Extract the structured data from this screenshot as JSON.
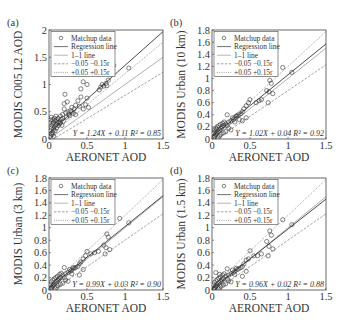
{
  "figure": {
    "xlabel": "AERONET AOD",
    "legend": {
      "items": [
        {
          "label": "Matchup data",
          "style": "marker"
        },
        {
          "label": "Regression line",
          "style": "solid-dark"
        },
        {
          "label": "1–1 line",
          "style": "solid-light"
        },
        {
          "label": "−0.05 −0.15r",
          "style": "dashed"
        },
        {
          "label": "+0.05 +0.15r",
          "style": "dotted"
        }
      ]
    },
    "colors": {
      "axis": "#444444",
      "regression": "#333333",
      "one_to_one": "#999999",
      "error_env": "#777777",
      "marker": "#333333"
    }
  },
  "chart_data": [
    {
      "type": "scatter",
      "panel_label": "(a)",
      "ylabel": "MODIS C005 L2 AOD",
      "xlabel": "AERONET AOD",
      "xlim": [
        0,
        1.5
      ],
      "ylim": [
        0,
        2
      ],
      "xticks": [
        0,
        0.5,
        1,
        1.5
      ],
      "xtick_labels": [
        "0",
        "0.5",
        "1",
        "1.5"
      ],
      "yticks": [
        0,
        0.5,
        1,
        1.5,
        2
      ],
      "ytick_labels": [
        "0",
        "0.5",
        "1",
        "1.5",
        "2"
      ],
      "regression": {
        "slope": 1.24,
        "intercept": 0.11,
        "r2": 0.85
      },
      "equation": "Y = 1.24X + 0.11 R² = 0.85",
      "points": [
        [
          1.05,
          1.3
        ],
        [
          0.85,
          1.35
        ],
        [
          0.78,
          1.08
        ],
        [
          0.75,
          1.02
        ],
        [
          0.72,
          0.97
        ],
        [
          0.7,
          1.0
        ],
        [
          0.68,
          0.95
        ],
        [
          0.76,
          0.98
        ],
        [
          0.66,
          0.9
        ],
        [
          0.45,
          1.05
        ],
        [
          0.42,
          0.92
        ],
        [
          0.5,
          1.0
        ],
        [
          0.21,
          0.82
        ],
        [
          0.42,
          0.77
        ],
        [
          0.5,
          0.75
        ],
        [
          0.48,
          0.63
        ],
        [
          0.38,
          0.7
        ],
        [
          0.35,
          0.62
        ],
        [
          0.3,
          0.58
        ],
        [
          0.33,
          0.55
        ],
        [
          0.28,
          0.52
        ],
        [
          0.25,
          0.5
        ],
        [
          0.22,
          0.48
        ],
        [
          0.26,
          0.45
        ],
        [
          0.2,
          0.55
        ],
        [
          0.2,
          0.65
        ],
        [
          0.24,
          0.68
        ],
        [
          0.3,
          0.5
        ],
        [
          0.32,
          0.47
        ],
        [
          0.4,
          0.6
        ],
        [
          0.45,
          0.55
        ],
        [
          0.52,
          0.58
        ],
        [
          0.18,
          0.45
        ],
        [
          0.15,
          0.42
        ],
        [
          0.12,
          0.38
        ],
        [
          0.1,
          0.35
        ],
        [
          0.08,
          0.33
        ],
        [
          0.06,
          0.3
        ],
        [
          0.05,
          0.28
        ],
        [
          0.04,
          0.25
        ],
        [
          0.03,
          0.2
        ],
        [
          0.02,
          0.15
        ],
        [
          0.03,
          0.1
        ],
        [
          0.05,
          0.12
        ],
        [
          0.06,
          0.18
        ],
        [
          0.07,
          0.22
        ],
        [
          0.09,
          0.26
        ],
        [
          0.11,
          0.3
        ],
        [
          0.13,
          0.32
        ],
        [
          0.02,
          0.05
        ],
        [
          0.04,
          0.08
        ],
        [
          0.06,
          0.05
        ],
        [
          0.08,
          0.15
        ],
        [
          0.1,
          0.2
        ],
        [
          0.12,
          0.25
        ],
        [
          0.14,
          0.28
        ],
        [
          0.16,
          0.36
        ],
        [
          0.18,
          0.38
        ],
        [
          0.01,
          0.3
        ],
        [
          0.02,
          0.35
        ],
        [
          0.03,
          0.4
        ],
        [
          0.05,
          0.35
        ],
        [
          0.07,
          0.38
        ],
        [
          0.09,
          0.42
        ],
        [
          0.15,
          0.3
        ],
        [
          0.17,
          0.25
        ],
        [
          0.19,
          0.33
        ],
        [
          0.23,
          0.4
        ],
        [
          0.27,
          0.43
        ],
        [
          0.35,
          0.45
        ]
      ]
    },
    {
      "type": "scatter",
      "panel_label": "(b)",
      "ylabel": "MODIS Urban (10 km)",
      "xlabel": "AERONET AOD",
      "xlim": [
        0,
        1.5
      ],
      "ylim": [
        0,
        1.8
      ],
      "xticks": [
        0,
        0.5,
        1,
        1.5
      ],
      "xtick_labels": [
        "0",
        "0.5",
        "1",
        "1.5"
      ],
      "yticks": [
        0,
        0.2,
        0.4,
        0.6,
        0.8,
        1,
        1.2,
        1.4,
        1.6,
        1.8
      ],
      "ytick_labels": [
        "0",
        "0.2",
        "0.4",
        "0.6",
        "0.8",
        "1",
        "1.2",
        "1.4",
        "1.6",
        "1.8"
      ],
      "regression": {
        "slope": 1.02,
        "intercept": 0.04,
        "r2": 0.92
      },
      "equation": "Y = 1.02X + 0.04 R² = 0.92",
      "points": [
        [
          0.93,
          1.18
        ],
        [
          1.05,
          1.1
        ],
        [
          0.76,
          0.97
        ],
        [
          0.78,
          0.92
        ],
        [
          0.72,
          0.8
        ],
        [
          0.75,
          0.78
        ],
        [
          0.8,
          0.75
        ],
        [
          0.74,
          0.6
        ],
        [
          0.65,
          0.65
        ],
        [
          0.62,
          0.63
        ],
        [
          0.58,
          0.6
        ],
        [
          0.5,
          0.65
        ],
        [
          0.48,
          0.6
        ],
        [
          0.45,
          0.55
        ],
        [
          0.42,
          0.5
        ],
        [
          0.4,
          0.45
        ],
        [
          0.38,
          0.42
        ],
        [
          0.35,
          0.4
        ],
        [
          0.45,
          0.35
        ],
        [
          0.4,
          0.3
        ],
        [
          0.33,
          0.38
        ],
        [
          0.3,
          0.35
        ],
        [
          0.28,
          0.32
        ],
        [
          0.25,
          0.3
        ],
        [
          0.22,
          0.28
        ],
        [
          0.2,
          0.4
        ],
        [
          0.18,
          0.25
        ],
        [
          0.15,
          0.22
        ],
        [
          0.13,
          0.2
        ],
        [
          0.12,
          0.18
        ],
        [
          0.1,
          0.15
        ],
        [
          0.08,
          0.12
        ],
        [
          0.06,
          0.1
        ],
        [
          0.05,
          0.08
        ],
        [
          0.04,
          0.05
        ],
        [
          0.03,
          0.03
        ],
        [
          0.02,
          0.1
        ],
        [
          0.03,
          0.15
        ],
        [
          0.05,
          0.18
        ],
        [
          0.07,
          0.2
        ],
        [
          0.09,
          0.22
        ],
        [
          0.11,
          0.24
        ],
        [
          0.14,
          0.26
        ],
        [
          0.16,
          0.28
        ],
        [
          0.2,
          0.22
        ],
        [
          0.22,
          0.18
        ],
        [
          0.25,
          0.15
        ],
        [
          0.18,
          0.12
        ],
        [
          0.15,
          0.1
        ],
        [
          0.12,
          0.08
        ],
        [
          0.1,
          0.05
        ],
        [
          0.08,
          0.02
        ],
        [
          0.02,
          0.02
        ],
        [
          0.04,
          0.12
        ],
        [
          0.06,
          0.16
        ],
        [
          0.27,
          0.35
        ],
        [
          0.3,
          0.28
        ],
        [
          0.32,
          0.38
        ],
        [
          0.36,
          0.32
        ]
      ]
    },
    {
      "type": "scatter",
      "panel_label": "(c)",
      "ylabel": "MODIS Urban (3 km)",
      "xlabel": "AERONET AOD",
      "xlim": [
        0,
        1.5
      ],
      "ylim": [
        0,
        1.8
      ],
      "xticks": [
        0,
        0.5,
        1,
        1.5
      ],
      "xtick_labels": [
        "0",
        "0.5",
        "1",
        "1.5"
      ],
      "yticks": [
        0,
        0.2,
        0.4,
        0.6,
        0.8,
        1,
        1.2,
        1.4,
        1.6,
        1.8
      ],
      "ytick_labels": [
        "0",
        "0.2",
        "0.4",
        "0.6",
        "0.8",
        "1",
        "1.2",
        "1.4",
        "1.6",
        "1.8"
      ],
      "regression": {
        "slope": 0.99,
        "intercept": 0.03,
        "r2": 0.9
      },
      "equation": "Y = 0.99X + 0.03 R² = 0.90",
      "points": [
        [
          0.93,
          1.15
        ],
        [
          1.05,
          1.08
        ],
        [
          0.76,
          0.9
        ],
        [
          0.78,
          0.85
        ],
        [
          0.72,
          0.72
        ],
        [
          0.75,
          0.68
        ],
        [
          0.8,
          0.65
        ],
        [
          0.74,
          0.58
        ],
        [
          0.65,
          0.62
        ],
        [
          0.6,
          0.6
        ],
        [
          0.55,
          0.58
        ],
        [
          0.5,
          0.62
        ],
        [
          0.48,
          0.55
        ],
        [
          0.45,
          0.5
        ],
        [
          0.42,
          0.45
        ],
        [
          0.4,
          0.42
        ],
        [
          0.38,
          0.38
        ],
        [
          0.35,
          0.36
        ],
        [
          0.45,
          0.33
        ],
        [
          0.4,
          0.24
        ],
        [
          0.33,
          0.35
        ],
        [
          0.3,
          0.32
        ],
        [
          0.28,
          0.3
        ],
        [
          0.25,
          0.28
        ],
        [
          0.22,
          0.26
        ],
        [
          0.2,
          0.36
        ],
        [
          0.18,
          0.24
        ],
        [
          0.15,
          0.2
        ],
        [
          0.13,
          0.18
        ],
        [
          0.12,
          0.16
        ],
        [
          0.1,
          0.14
        ],
        [
          0.08,
          0.11
        ],
        [
          0.06,
          0.09
        ],
        [
          0.05,
          0.07
        ],
        [
          0.04,
          0.05
        ],
        [
          0.03,
          0.03
        ],
        [
          0.02,
          0.09
        ],
        [
          0.03,
          0.13
        ],
        [
          0.05,
          0.16
        ],
        [
          0.07,
          0.18
        ],
        [
          0.09,
          0.2
        ],
        [
          0.11,
          0.22
        ],
        [
          0.14,
          0.25
        ],
        [
          0.16,
          0.27
        ],
        [
          0.2,
          0.2
        ],
        [
          0.22,
          0.16
        ],
        [
          0.25,
          0.14
        ],
        [
          0.18,
          0.11
        ],
        [
          0.15,
          0.09
        ],
        [
          0.12,
          0.07
        ],
        [
          0.1,
          0.04
        ],
        [
          0.08,
          0.02
        ],
        [
          0.02,
          0.02
        ],
        [
          0.27,
          0.33
        ],
        [
          0.3,
          0.26
        ],
        [
          0.32,
          0.36
        ]
      ]
    },
    {
      "type": "scatter",
      "panel_label": "(d)",
      "ylabel": "MODIS Urban (1.5 km)",
      "xlabel": "AERONET AOD",
      "xlim": [
        0,
        1.5
      ],
      "ylim": [
        0,
        1.8
      ],
      "xticks": [
        0,
        0.5,
        1,
        1.5
      ],
      "xtick_labels": [
        "0",
        "0.5",
        "1",
        "1.5"
      ],
      "yticks": [
        0,
        0.2,
        0.4,
        0.6,
        0.8,
        1,
        1.2,
        1.4,
        1.6,
        1.8
      ],
      "ytick_labels": [
        "0",
        "0.2",
        "0.4",
        "0.6",
        "0.8",
        "1",
        "1.2",
        "1.4",
        "1.6",
        "1.8"
      ],
      "regression": {
        "slope": 0.96,
        "intercept": 0.02,
        "r2": 0.88
      },
      "equation": "Y = 0.96X + 0.02 R² = 0.88",
      "points": [
        [
          0.93,
          1.13
        ],
        [
          1.05,
          1.05
        ],
        [
          0.76,
          0.95
        ],
        [
          0.78,
          0.88
        ],
        [
          0.72,
          0.78
        ],
        [
          0.75,
          0.7
        ],
        [
          0.8,
          0.66
        ],
        [
          0.74,
          0.55
        ],
        [
          0.65,
          0.58
        ],
        [
          0.6,
          0.55
        ],
        [
          0.55,
          0.55
        ],
        [
          0.5,
          0.63
        ],
        [
          0.48,
          0.5
        ],
        [
          0.45,
          0.48
        ],
        [
          0.42,
          0.42
        ],
        [
          0.4,
          0.38
        ],
        [
          0.38,
          0.36
        ],
        [
          0.35,
          0.34
        ],
        [
          0.45,
          0.3
        ],
        [
          0.4,
          0.22
        ],
        [
          0.33,
          0.33
        ],
        [
          0.3,
          0.3
        ],
        [
          0.28,
          0.28
        ],
        [
          0.25,
          0.26
        ],
        [
          0.22,
          0.24
        ],
        [
          0.2,
          0.34
        ],
        [
          0.18,
          0.22
        ],
        [
          0.15,
          0.18
        ],
        [
          0.13,
          0.16
        ],
        [
          0.12,
          0.14
        ],
        [
          0.1,
          0.12
        ],
        [
          0.08,
          0.1
        ],
        [
          0.06,
          0.08
        ],
        [
          0.05,
          0.06
        ],
        [
          0.04,
          0.04
        ],
        [
          0.03,
          0.02
        ],
        [
          0.02,
          0.08
        ],
        [
          0.03,
          0.12
        ],
        [
          0.05,
          0.15
        ],
        [
          0.07,
          0.17
        ],
        [
          0.09,
          0.19
        ],
        [
          0.11,
          0.21
        ],
        [
          0.14,
          0.24
        ],
        [
          0.16,
          0.26
        ],
        [
          0.2,
          0.18
        ],
        [
          0.22,
          0.15
        ],
        [
          0.25,
          0.13
        ],
        [
          0.18,
          0.1
        ],
        [
          0.15,
          0.08
        ],
        [
          0.12,
          0.06
        ],
        [
          0.1,
          0.03
        ],
        [
          0.08,
          0.02
        ],
        [
          0.02,
          0.02
        ],
        [
          0.27,
          0.32
        ],
        [
          0.3,
          0.25
        ],
        [
          0.32,
          0.35
        ],
        [
          0.05,
          0.28
        ],
        [
          0.1,
          0.25
        ]
      ]
    }
  ],
  "layout": {
    "panels": [
      {
        "left": 49,
        "top": 30,
        "width": 114,
        "height": 109
      },
      {
        "left": 212,
        "top": 30,
        "width": 114,
        "height": 109
      },
      {
        "left": 49,
        "top": 178,
        "width": 114,
        "height": 112
      },
      {
        "left": 212,
        "top": 178,
        "width": 114,
        "height": 112
      }
    ]
  }
}
